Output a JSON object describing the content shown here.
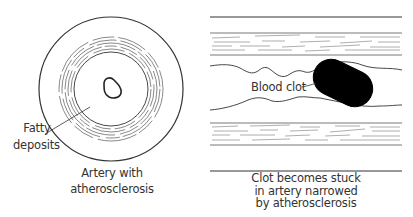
{
  "left_panel": {
    "label_fatty": [
      "Fatty",
      "deposits"
    ],
    "caption": [
      "Artery with",
      "atherosclerosis"
    ]
  },
  "right_panel": {
    "label_clot": "Blood clot",
    "caption": [
      "Clot becomes stuck",
      "in artery narrowed",
      "by atherosclerosis"
    ]
  },
  "colors": {
    "stroke": "#333333",
    "clot": "#000000",
    "background": "#ffffff"
  }
}
